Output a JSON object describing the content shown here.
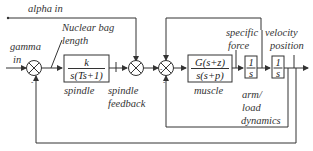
{
  "diagram": {
    "type": "block-diagram",
    "inputs": {
      "alpha": "alpha in",
      "gamma_line1": "gamma",
      "gamma_line2": "in"
    },
    "blocks": {
      "spindle": {
        "num": "k",
        "den": "s(Ts+1)",
        "label": "spindle"
      },
      "muscle": {
        "num": "G(s+z)",
        "den": "s(s+p)",
        "label": "muscle"
      },
      "integrator1": {
        "num": "1",
        "den": "s"
      },
      "integrator2": {
        "num": "1",
        "den": "s"
      }
    },
    "signals": {
      "nuclear_bag_line1": "Nuclear bag",
      "nuclear_bag_line2": "length",
      "spindle_feedback_line1": "spindle",
      "spindle_feedback_line2": "feedback",
      "specific_force_line1": "specific",
      "specific_force_line2": "force",
      "velocity": "velocity",
      "position": "position",
      "arm_line1": "arm/",
      "arm_line2": "load",
      "arm_line3": "dynamics"
    },
    "junction_signs": {
      "j1_bottom": "-",
      "j3_left": "-",
      "j3_bottom": "-"
    },
    "colors": {
      "line": "#333333",
      "background": "#ffffff"
    }
  }
}
